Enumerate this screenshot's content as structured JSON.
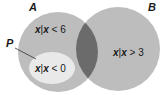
{
  "diagram": {
    "type": "venn",
    "sets": [
      {
        "id": "A",
        "label": "A",
        "description": "x|x < 6",
        "var": "x",
        "cond": " < 6"
      },
      {
        "id": "B",
        "label": "B",
        "description": "x|x > 3",
        "var": "x",
        "cond": " > 3"
      },
      {
        "id": "P",
        "label": "P",
        "description": "x|x < 0",
        "var": "x",
        "cond": " < 0",
        "subset_of": "A"
      }
    ],
    "intersection": {
      "of": [
        "A",
        "B"
      ],
      "highlighted": true
    },
    "colors": {
      "set_fill": "#bdbdbd",
      "intersection_fill": "#6b6b6b",
      "subset_fill": "#e9e9e9",
      "text": "#1a1a1a"
    }
  }
}
